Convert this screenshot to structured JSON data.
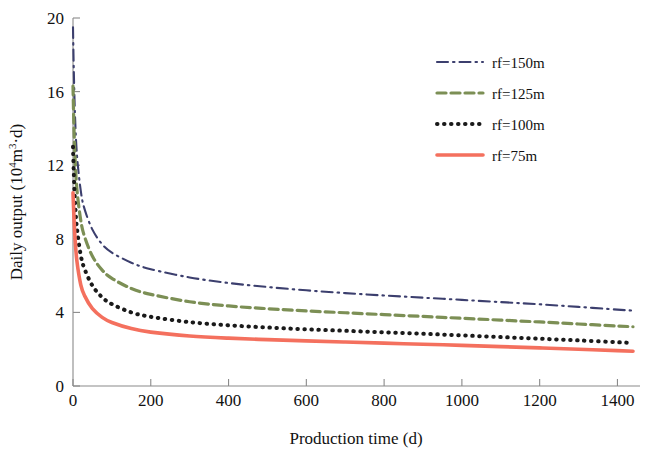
{
  "chart_data": {
    "type": "line",
    "title": "",
    "xlabel": "Production time (d)",
    "ylabel": "Daily output (10⁴m³·d)",
    "xlim": [
      0,
      1440
    ],
    "ylim": [
      0,
      20
    ],
    "xticks": [
      0,
      200,
      400,
      600,
      800,
      1000,
      1200,
      1400
    ],
    "yticks": [
      0,
      4,
      8,
      12,
      16,
      20
    ],
    "grid": false,
    "legend_position": "upper-right",
    "x": [
      0,
      2,
      5,
      10,
      20,
      30,
      50,
      75,
      100,
      150,
      200,
      300,
      400,
      500,
      600,
      700,
      800,
      900,
      1000,
      1100,
      1200,
      1300,
      1400,
      1440
    ],
    "series": [
      {
        "name": "rf=150m",
        "label": "rf=150m",
        "color": "#3c3f6e",
        "style": "dash-dot",
        "values": [
          19.5,
          17.2,
          14.8,
          12.6,
          10.6,
          9.6,
          8.5,
          7.7,
          7.25,
          6.7,
          6.35,
          5.9,
          5.6,
          5.38,
          5.2,
          5.05,
          4.92,
          4.8,
          4.68,
          4.56,
          4.44,
          4.3,
          4.15,
          4.1
        ]
      },
      {
        "name": "rf=125m",
        "label": "rf=125m",
        "color": "#7c8f55",
        "style": "dashed",
        "values": [
          16.3,
          14.4,
          12.5,
          10.7,
          9.0,
          8.1,
          7.05,
          6.3,
          5.85,
          5.3,
          4.98,
          4.58,
          4.35,
          4.2,
          4.08,
          3.98,
          3.88,
          3.78,
          3.68,
          3.58,
          3.48,
          3.37,
          3.26,
          3.22
        ]
      },
      {
        "name": "rf=100m",
        "label": "rf=100m",
        "color": "#1a1a1a",
        "style": "dotted",
        "values": [
          13.0,
          11.6,
          10.1,
          8.6,
          7.1,
          6.35,
          5.45,
          4.82,
          4.45,
          4.0,
          3.76,
          3.47,
          3.3,
          3.18,
          3.08,
          3.0,
          2.92,
          2.84,
          2.75,
          2.66,
          2.57,
          2.48,
          2.38,
          2.34
        ]
      },
      {
        "name": "rf=75m",
        "label": "rf=75m",
        "color": "#f4705e",
        "style": "solid",
        "values": [
          10.5,
          9.4,
          8.1,
          6.8,
          5.5,
          4.9,
          4.2,
          3.73,
          3.45,
          3.12,
          2.93,
          2.72,
          2.6,
          2.52,
          2.45,
          2.39,
          2.33,
          2.27,
          2.21,
          2.14,
          2.07,
          2.0,
          1.92,
          1.89
        ]
      }
    ]
  },
  "axes": {
    "x_tick_labels": [
      "0",
      "200",
      "400",
      "600",
      "800",
      "1000",
      "1200",
      "1400"
    ],
    "y_tick_labels": [
      "0",
      "4",
      "8",
      "12",
      "16",
      "20"
    ],
    "x_axis_title": "Production time (d)",
    "y_axis_title_main": "Daily output (10",
    "y_axis_title_sup1": "4",
    "y_axis_title_mid": "m",
    "y_axis_title_sup2": "3",
    "y_axis_title_end": "·d)"
  },
  "legend": {
    "items": [
      {
        "label": "rf=150m",
        "color": "#3c3f6e",
        "style": "dash-dot"
      },
      {
        "label": "rf=125m",
        "color": "#7c8f55",
        "style": "dashed"
      },
      {
        "label": "rf=100m",
        "color": "#1a1a1a",
        "style": "dotted"
      },
      {
        "label": "rf=75m",
        "color": "#f4705e",
        "style": "solid"
      }
    ]
  }
}
